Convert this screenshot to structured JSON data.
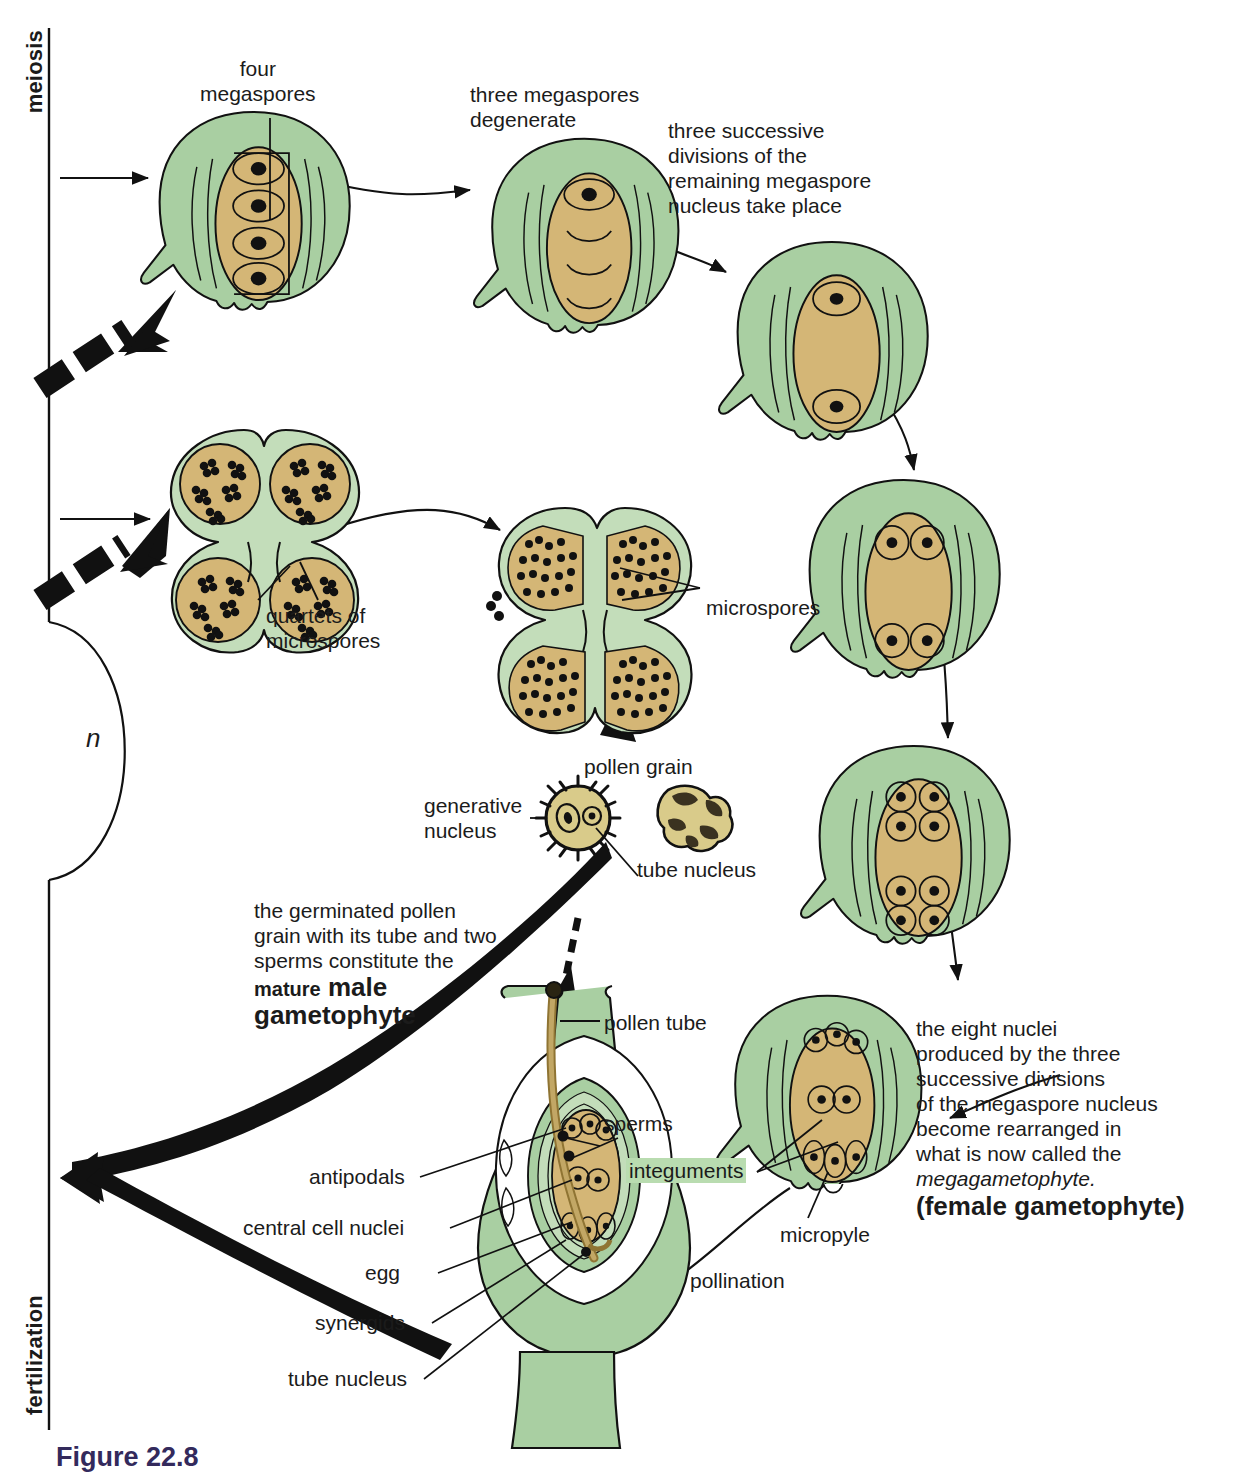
{
  "figure": {
    "caption": "Figure 22.8"
  },
  "colors": {
    "tissue_green": "#a9cfa2",
    "tissue_green_light": "#c3ddba",
    "nucellus_tan": "#d4b676",
    "pollen_tan": "#d9cb8a",
    "outline": "#111111",
    "highlight_green": "#b9dcb0",
    "caption_purple": "#332a5c"
  },
  "axis": {
    "meiosis_label": "meiosis",
    "fertilization_label": "fertilization",
    "ploidy_label": "n"
  },
  "labels": {
    "four_megaspores": "four\nmegaspores",
    "three_degenerate": "three megaspores\ndegenerate",
    "three_divisions": "three successive\ndivisions of the\nremaining megaspore\nnucleus take place",
    "quartets": "quartets of\nmicrospores",
    "microspores": "microspores",
    "pollen_grain": "pollen grain",
    "generative_nucleus": "generative\nnucleus",
    "tube_nucleus": "tube nucleus",
    "pollen_tube": "pollen tube",
    "sperms": "sperms",
    "antipodals": "antipodals",
    "central_cell_nuclei": "central cell nuclei",
    "egg": "egg",
    "synergids": "synergids",
    "tube_nucleus_2": "tube nucleus",
    "integuments": "integuments",
    "micropyle": "micropyle",
    "pollination": "pollination"
  },
  "callouts": {
    "male_gametophyte": {
      "line1": "the germinated pollen",
      "line2": "grain with its tube and two",
      "line3": "sperms constitute the",
      "emph_small": "mature",
      "emph_large_1": "male",
      "emph_large_2": "gametophyte"
    },
    "female_gametophyte": {
      "line1": "the eight nuclei",
      "line2": "produced by the three",
      "line3": "successive divisions",
      "line4": "of the megaspore nucleus",
      "line5": "become rearranged in",
      "line6": "what is now called the",
      "italic_line": "megagametophyte.",
      "bold_line": "(female gametophyte)"
    }
  },
  "stages": [
    {
      "id": "ovule-four-megaspores",
      "name": "Ovule with four megaspores",
      "nuclei": 4
    },
    {
      "id": "ovule-three-degenerate",
      "name": "Ovule, three megaspores degenerate",
      "nuclei": 1
    },
    {
      "id": "ovule-two-nuclei",
      "name": "Ovule after first division",
      "nuclei": 2
    },
    {
      "id": "ovule-four-nuclei",
      "name": "Ovule after second division",
      "nuclei": 4
    },
    {
      "id": "ovule-eight-nuclei",
      "name": "Ovule after third division",
      "nuclei": 8
    },
    {
      "id": "ovule-megagametophyte",
      "name": "Mature megagametophyte",
      "nuclei": 8
    },
    {
      "id": "anther-quartets",
      "name": "Anther with quartets of microspores",
      "lobes": 4
    },
    {
      "id": "anther-microspores",
      "name": "Anther releasing microspores",
      "lobes": 4
    },
    {
      "id": "pollen-grain-sectioned",
      "name": "Pollen grain in section",
      "nuclei": 2
    },
    {
      "id": "pollen-grain-surface",
      "name": "Pollen grain surface view",
      "nuclei": 0
    },
    {
      "id": "ovary-fertilization",
      "name": "Ovule with pollen tube reaching embryo sac",
      "nuclei": 8
    }
  ]
}
